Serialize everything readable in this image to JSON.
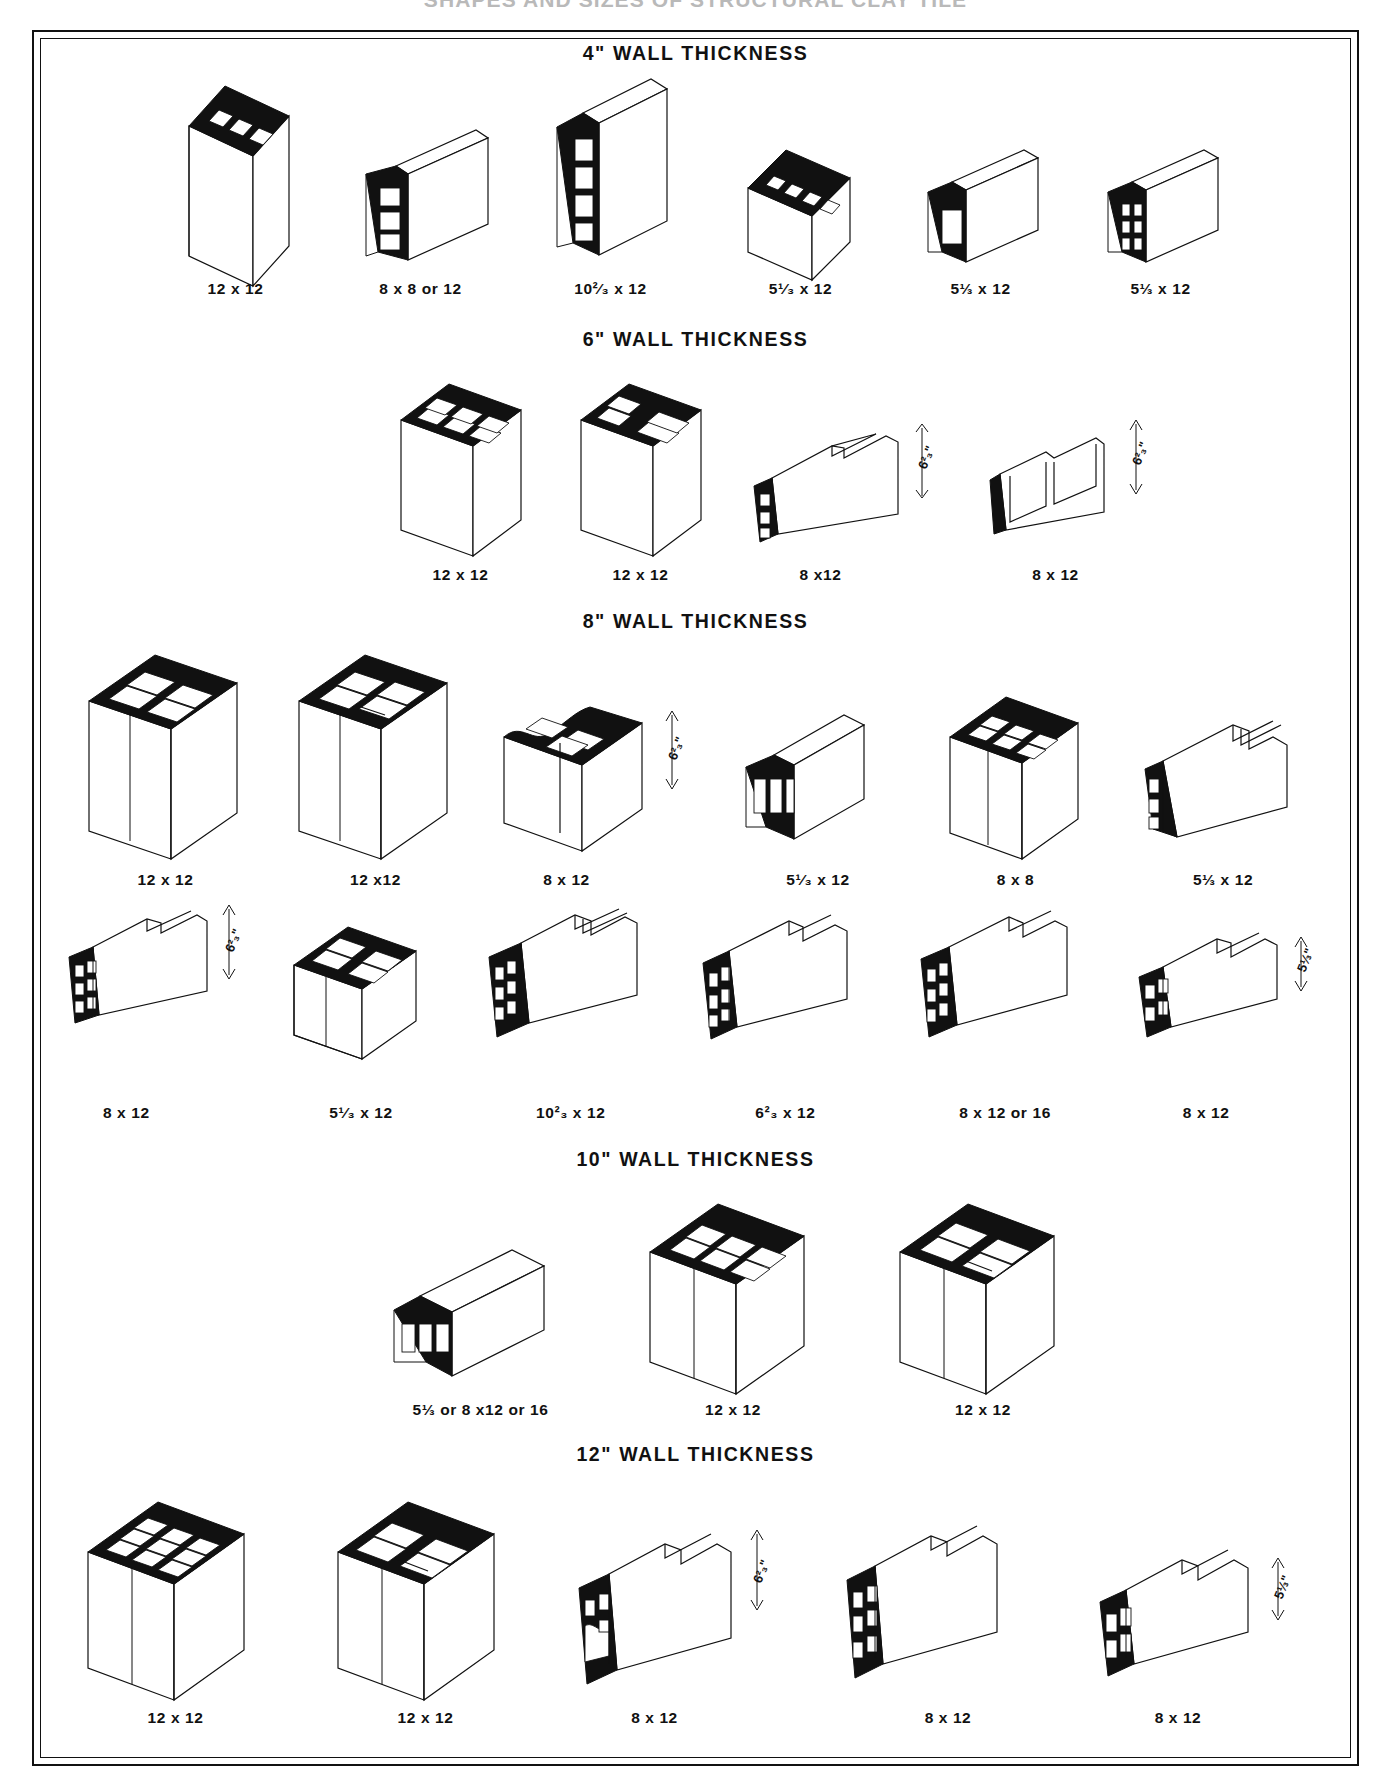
{
  "document": {
    "title": "SHAPES AND SIZES OF STRUCTURAL CLAY TILE"
  },
  "sections": [
    {
      "id": "wall-4",
      "title": "4\" WALL THICKNESS",
      "rows": [
        {
          "items": [
            {
              "caption": "12 x 12",
              "type": "tall-vertical-3cell",
              "dim": ""
            },
            {
              "caption": "8 x 8 or 12",
              "type": "flat-horizontal-3cell",
              "dim": ""
            },
            {
              "caption": "10²⁄₃ x 12",
              "type": "tall-vertical-4cell",
              "dim": ""
            },
            {
              "caption": "5¹⁄₃ x 12",
              "type": "low-vertical-4cell",
              "dim": ""
            },
            {
              "caption": "5⅓ x 12",
              "type": "low-open-1cell",
              "dim": ""
            },
            {
              "caption": "5⅓ x 12",
              "type": "low-small-6cell",
              "dim": ""
            }
          ]
        }
      ]
    },
    {
      "id": "wall-6",
      "title": "6\" WALL THICKNESS",
      "rows": [
        {
          "items": [
            {
              "caption": "12 x 12",
              "type": "box-6cell",
              "dim": ""
            },
            {
              "caption": "12 x 12",
              "type": "box-6cell-alt",
              "dim": ""
            },
            {
              "caption": "8 x12",
              "type": "profile-pair-left",
              "dim": "6²₃\""
            },
            {
              "caption": "8 x 12",
              "type": "profile-pair-right",
              "dim": "6²₃\""
            }
          ]
        }
      ]
    },
    {
      "id": "wall-8",
      "title": "8\" WALL THICKNESS",
      "rows": [
        {
          "items": [
            {
              "caption": "12 x 12",
              "type": "cube-4cell",
              "dim": ""
            },
            {
              "caption": "12 x12",
              "type": "cube-4cell-split",
              "dim": ""
            },
            {
              "caption": "8 x 12",
              "type": "wavy-top-block",
              "dim": "6²₃\""
            },
            {
              "caption": "5¹⁄₃ x 12",
              "type": "low-box-3cell",
              "dim": ""
            },
            {
              "caption": "8 x 8",
              "type": "cube-6cell",
              "dim": ""
            },
            {
              "caption": "5⅓ x 12",
              "type": "ribbed-long",
              "dim": ""
            }
          ]
        },
        {
          "items": [
            {
              "caption": "8 x 12",
              "type": "profile-webbed-a",
              "dim": "6²₃\""
            },
            {
              "caption": "5¹⁄₃ x 12",
              "type": "open-frame-block",
              "dim": ""
            },
            {
              "caption": "10²₃ x 12",
              "type": "deep-webbed",
              "dim": ""
            },
            {
              "caption": "6²₃ x 12",
              "type": "channel-webbed",
              "dim": ""
            },
            {
              "caption": "8 x 12 or 16",
              "type": "double-webbed",
              "dim": ""
            },
            {
              "caption": "8 x 12",
              "type": "low-webbed-wide",
              "dim": "5⅓\""
            }
          ]
        }
      ]
    },
    {
      "id": "wall-10",
      "title": "10\" WALL THICKNESS",
      "rows": [
        {
          "items": [
            {
              "caption": "5⅓ or 8 x12 or 16",
              "type": "flat-3cell-wide",
              "dim": ""
            },
            {
              "caption": "12 x 12",
              "type": "cube-6cell-big",
              "dim": ""
            },
            {
              "caption": "12 x 12",
              "type": "cube-4cell-big",
              "dim": ""
            }
          ]
        }
      ]
    },
    {
      "id": "wall-12",
      "title": "12\" WALL THICKNESS",
      "rows": [
        {
          "items": [
            {
              "caption": "12 x 12",
              "type": "cube-9cell",
              "dim": ""
            },
            {
              "caption": "12 x 12",
              "type": "cube-4cell-split-big",
              "dim": ""
            },
            {
              "caption": "8 x 12",
              "type": "profile-wavy-12",
              "dim": "6²₃\""
            },
            {
              "caption": "8 x 12",
              "type": "profile-grid-12",
              "dim": ""
            },
            {
              "caption": "8 x 12",
              "type": "profile-low-12",
              "dim": "5⅓\""
            }
          ]
        }
      ]
    }
  ]
}
